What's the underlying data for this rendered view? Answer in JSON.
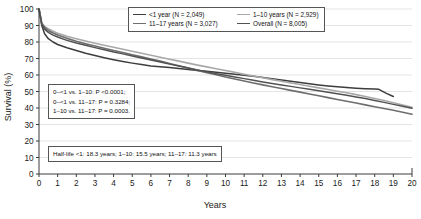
{
  "chart_data": {
    "type": "line",
    "title": "",
    "xlabel": "Years",
    "ylabel": "Survival (%)",
    "xlim": [
      0,
      20
    ],
    "ylim": [
      0,
      100
    ],
    "xticks": [
      "0",
      "1",
      "2",
      "3",
      "4",
      "5",
      "6",
      "7",
      "8",
      "9",
      "10",
      "11",
      "12",
      "13",
      "14",
      "15",
      "16",
      "17",
      "18",
      "19",
      "20"
    ],
    "yticks": [
      "0",
      "10",
      "20",
      "30",
      "40",
      "50",
      "60",
      "70",
      "80",
      "90",
      "100"
    ],
    "grid": "horizontal",
    "legend_position": "top-center",
    "series": [
      {
        "name": "<1 year (N = 2,049)",
        "short_name": "<1 year",
        "n": "2,049",
        "color": "#3d3d3d",
        "width": 1.5,
        "x": [
          0,
          0.15,
          0.3,
          0.5,
          0.75,
          1,
          1.5,
          2,
          2.5,
          3,
          3.5,
          4,
          4.5,
          5,
          5.5,
          6,
          6.5,
          7,
          7.5,
          8,
          8.5,
          9,
          9.5,
          10,
          10.5,
          11,
          11.5,
          12,
          12.5,
          13,
          13.5,
          14,
          14.5,
          15,
          15.5,
          16,
          16.5,
          17,
          17.5,
          18,
          18.2,
          18.6,
          19
        ],
        "y": [
          100,
          90,
          85,
          82,
          80,
          78.5,
          76.5,
          74.8,
          73.2,
          71.8,
          70.5,
          69.3,
          68.2,
          67.2,
          66.3,
          65.5,
          65.0,
          64.5,
          64.0,
          63.4,
          62.8,
          62.2,
          61.6,
          61.0,
          60.4,
          59.8,
          59.2,
          58.5,
          57.8,
          57.0,
          56.2,
          55.4,
          54.7,
          54.0,
          53.4,
          52.9,
          52.4,
          52.0,
          51.7,
          51.5,
          51.4,
          49.0,
          47.0
        ]
      },
      {
        "name": "1–10 years (N = 2,929)",
        "short_name": "1–10 years",
        "n": "2,929",
        "color": "#a8a8a8",
        "width": 1.6,
        "x": [
          0,
          0.15,
          0.3,
          0.5,
          0.75,
          1,
          1.5,
          2,
          2.5,
          3,
          3.5,
          4,
          4.5,
          5,
          5.5,
          6,
          6.5,
          7,
          7.5,
          8,
          8.5,
          9,
          9.5,
          10,
          10.5,
          11,
          11.5,
          12,
          12.5,
          13,
          13.5,
          14,
          14.5,
          15,
          15.5,
          16,
          16.5,
          17,
          17.5,
          18,
          18.5,
          19,
          19.5,
          20
        ],
        "y": [
          100,
          91.5,
          89.5,
          88.0,
          86.5,
          85.3,
          83.5,
          82.0,
          80.6,
          79.3,
          78.0,
          76.8,
          75.6,
          74.4,
          73.2,
          72.0,
          70.8,
          69.6,
          68.4,
          67.2,
          66.0,
          64.9,
          63.8,
          62.7,
          61.6,
          60.5,
          59.4,
          58.3,
          57.2,
          56.2,
          55.2,
          54.2,
          53.2,
          52.2,
          51.2,
          50.2,
          49.2,
          48.1,
          47.0,
          45.8,
          44.5,
          43.2,
          41.8,
          40.5
        ]
      },
      {
        "name": "11–17 years (N = 3,027)",
        "short_name": "11–17 years",
        "n": "3,027",
        "color": "#6e6e6e",
        "width": 1.6,
        "x": [
          0,
          0.15,
          0.3,
          0.5,
          0.75,
          1,
          1.5,
          2,
          2.5,
          3,
          3.5,
          4,
          4.5,
          5,
          5.5,
          6,
          6.5,
          7,
          7.5,
          8,
          8.5,
          9,
          9.5,
          10,
          10.5,
          11,
          11.5,
          12,
          12.5,
          13,
          13.5,
          14,
          14.5,
          15,
          15.5,
          16,
          16.5,
          17,
          17.5,
          18,
          18.5,
          19,
          19.5,
          20
        ],
        "y": [
          100,
          91.0,
          88.8,
          87.0,
          85.5,
          84.2,
          82.2,
          80.5,
          79.0,
          77.6,
          76.2,
          74.9,
          73.6,
          72.3,
          71.0,
          69.7,
          68.4,
          67.0,
          65.6,
          64.2,
          62.8,
          61.4,
          60.1,
          58.8,
          57.6,
          56.4,
          55.2,
          54.0,
          52.9,
          51.8,
          50.7,
          49.6,
          48.5,
          47.4,
          46.3,
          45.2,
          44.1,
          43.0,
          41.9,
          40.8,
          39.7,
          38.6,
          37.4,
          36.2
        ]
      },
      {
        "name": "Overall (N = 8,005)",
        "short_name": "Overall",
        "n": "8,005",
        "color": "#525252",
        "width": 1.5,
        "x": [
          0,
          0.15,
          0.3,
          0.5,
          0.75,
          1,
          1.5,
          2,
          2.5,
          3,
          3.5,
          4,
          4.5,
          5,
          5.5,
          6,
          6.5,
          7,
          7.5,
          8,
          8.5,
          9,
          9.5,
          10,
          10.5,
          11,
          11.5,
          12,
          12.5,
          13,
          13.5,
          14,
          14.5,
          15,
          15.5,
          16,
          16.5,
          17,
          17.5,
          18,
          18.5,
          19,
          19.5,
          20
        ],
        "y": [
          100,
          90.8,
          87.8,
          85.8,
          84.2,
          83.0,
          81.0,
          79.4,
          78.0,
          76.6,
          75.3,
          74.0,
          72.8,
          71.5,
          70.3,
          69.1,
          67.9,
          66.6,
          65.4,
          64.2,
          63.0,
          61.9,
          60.8,
          59.8,
          58.8,
          57.8,
          56.8,
          55.8,
          54.9,
          54.0,
          53.1,
          52.2,
          51.3,
          50.4,
          49.5,
          48.6,
          47.7,
          46.7,
          45.7,
          44.6,
          43.4,
          42.2,
          41.0,
          39.8
        ]
      }
    ],
    "annotations": [
      {
        "id": "pvalues",
        "lines": [
          "0–<1 vs. 1–10: P <0.0001;",
          "0–<1 vs. 11–17: P = 0.3284;",
          "1–10 vs. 11–17: P = 0.0003."
        ]
      },
      {
        "id": "halflife",
        "lines": [
          "Half-life <1: 18.3 years; 1–10: 15.5 years; 11–17: 11.3 years"
        ]
      }
    ]
  },
  "legend": {
    "rows": [
      [
        {
          "label": "<1 year (N = 2,049)",
          "color": "#3d3d3d",
          "width": "1.6px"
        },
        {
          "label": "1–10 years (N = 2,929)",
          "color": "#a8a8a8",
          "width": "1.8px"
        }
      ],
      [
        {
          "label": "11–17 years (N = 3,027)",
          "color": "#6e6e6e",
          "width": "1.8px"
        },
        {
          "label": "Overall (N = 8,005)",
          "color": "#525252",
          "width": "1.6px"
        }
      ]
    ]
  },
  "annotations": {
    "pvalue_line1": "0–<1 vs. 1–10: P <0.0001;",
    "pvalue_line2": "0–<1 vs. 11–17: P = 0.3284;",
    "pvalue_line3": "1–10 vs. 11–17: P = 0.0003.",
    "halflife_line1": "Half-life <1: 18.3 years; 1–10: 15.5 years; 11–17: 11.3 years"
  },
  "axes": {
    "x_title": "Years",
    "y_title": "Survival (%)"
  }
}
